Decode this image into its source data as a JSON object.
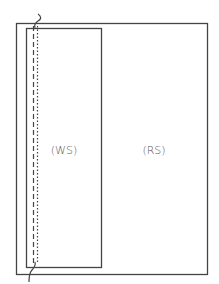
{
  "diagram": {
    "outer_region": {
      "label": "(RS)",
      "x": 16,
      "y": 23,
      "width": 192,
      "height": 252
    },
    "inner_region": {
      "label": "(WS)",
      "x": 26,
      "y": 28,
      "width": 76,
      "height": 240
    },
    "dashed_line_x": 33,
    "dotted_line_x": 37,
    "colors": {
      "stroke": "#444444",
      "text": "#555555",
      "background": "#ffffff"
    }
  }
}
